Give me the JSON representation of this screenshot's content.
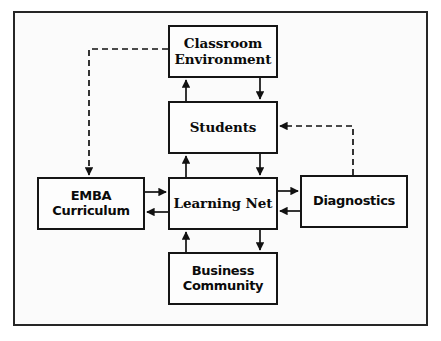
{
  "diagram": {
    "frame": {
      "border_color": "#262626",
      "background": "#fbfbfb"
    },
    "nodes": [
      {
        "id": "classroom-environment",
        "label": "Classroom\nEnvironment",
        "font": "serif",
        "x": 168,
        "y": 25,
        "w": 110,
        "h": 53
      },
      {
        "id": "students",
        "label": "Students",
        "font": "serif",
        "x": 168,
        "y": 101,
        "w": 110,
        "h": 53
      },
      {
        "id": "emba-curriculum",
        "label": "EMBA\nCurriculum",
        "font": "sans",
        "x": 37,
        "y": 177,
        "w": 108,
        "h": 53
      },
      {
        "id": "learning-net",
        "label": "Learning Net",
        "font": "serif",
        "x": 168,
        "y": 177,
        "w": 110,
        "h": 53
      },
      {
        "id": "diagnostics",
        "label": "Diagnostics",
        "font": "sans",
        "x": 300,
        "y": 175,
        "w": 108,
        "h": 53
      },
      {
        "id": "business-community",
        "label": "Business\nCommunity",
        "font": "sans",
        "x": 168,
        "y": 252,
        "w": 110,
        "h": 53
      }
    ],
    "connectors": [
      {
        "id": "students-to-classroom",
        "from": "students",
        "to": "classroom-environment",
        "style": "solid",
        "direction": "up"
      },
      {
        "id": "classroom-to-students",
        "from": "classroom-environment",
        "to": "students",
        "style": "solid",
        "direction": "down"
      },
      {
        "id": "learningnet-to-students",
        "from": "learning-net",
        "to": "students",
        "style": "solid",
        "direction": "up"
      },
      {
        "id": "students-to-learningnet",
        "from": "students",
        "to": "learning-net",
        "style": "solid",
        "direction": "down"
      },
      {
        "id": "businesscommunity-to-learningnet",
        "from": "business-community",
        "to": "learning-net",
        "style": "solid",
        "direction": "up"
      },
      {
        "id": "learningnet-to-businesscommunity",
        "from": "learning-net",
        "to": "business-community",
        "style": "solid",
        "direction": "down"
      },
      {
        "id": "emba-to-learningnet",
        "from": "emba-curriculum",
        "to": "learning-net",
        "style": "solid",
        "direction": "right"
      },
      {
        "id": "learningnet-to-emba",
        "from": "learning-net",
        "to": "emba-curriculum",
        "style": "solid",
        "direction": "left"
      },
      {
        "id": "learningnet-to-diagnostics",
        "from": "learning-net",
        "to": "diagnostics",
        "style": "solid",
        "direction": "right"
      },
      {
        "id": "diagnostics-to-learningnet",
        "from": "diagnostics",
        "to": "learning-net",
        "style": "solid",
        "direction": "left"
      },
      {
        "id": "classroom-to-emba-feedback",
        "from": "classroom-environment",
        "to": "emba-curriculum",
        "style": "dashed",
        "direction": "down"
      },
      {
        "id": "diagnostics-to-students-feedback",
        "from": "diagnostics",
        "to": "students",
        "style": "dashed",
        "direction": "left"
      }
    ]
  }
}
